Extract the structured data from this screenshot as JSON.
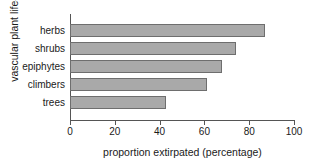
{
  "chart_data": {
    "type": "bar",
    "orientation": "horizontal",
    "title": "",
    "xlabel": "proportion extirpated (percentage)",
    "ylabel": "vascular plant life-form",
    "categories": [
      "herbs",
      "shrubs",
      "epiphytes",
      "climbers",
      "trees"
    ],
    "values": [
      87,
      74,
      68,
      61,
      43
    ],
    "xlim": [
      0,
      100
    ],
    "xticks": [
      0,
      20,
      40,
      60,
      80,
      100
    ],
    "xtick_labels": [
      "0",
      "20",
      "40",
      "60",
      "80",
      "100"
    ],
    "grid": false,
    "legend": null,
    "bar_color": "#a9a9a9",
    "bar_edge_color": "#6e6e6e",
    "axis_color": "#555555"
  }
}
